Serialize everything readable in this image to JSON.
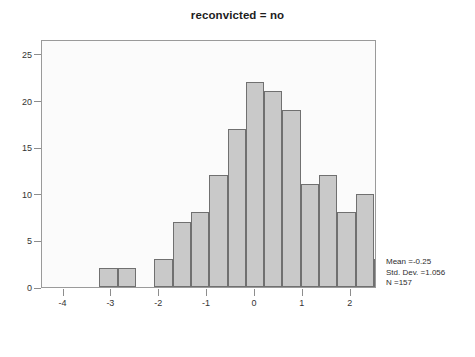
{
  "chart_data": {
    "type": "bar",
    "title": "reconvicted = no",
    "xlabel": "",
    "ylabel": "",
    "xlim": [
      -4.45,
      2.55
    ],
    "ylim": [
      0,
      26.6
    ],
    "grid": false,
    "legend": null,
    "bin_width": 0.3825,
    "bin_starts": [
      -3.25,
      -2.8675,
      -2.485,
      -2.1025,
      -1.72,
      -1.3375,
      -0.955,
      -0.5725,
      -0.19,
      0.1925,
      0.575,
      0.9575,
      1.34,
      1.7225,
      2.105,
      2.4875
    ],
    "categories": [
      "-3.25",
      "-2.87",
      "-2.48",
      "-2.10",
      "-1.72",
      "-1.34",
      "-0.96",
      "-0.57",
      "-0.19",
      "0.19",
      "0.58",
      "0.96",
      "1.34",
      "1.72",
      "2.11",
      "2.49"
    ],
    "values": [
      2,
      2,
      0,
      3,
      7,
      8,
      12,
      17,
      22,
      21,
      19,
      11,
      12,
      8,
      10,
      3
    ],
    "x_ticks": [
      -4,
      -3,
      -2,
      -1,
      0,
      1,
      2
    ],
    "x_tick_labels": [
      "-4",
      "-3",
      "-2",
      "-1",
      "0",
      "1",
      "2"
    ],
    "y_ticks": [
      0,
      5,
      10,
      15,
      20,
      25
    ],
    "y_tick_labels": [
      "0",
      "5",
      "10",
      "15",
      "20",
      "25"
    ],
    "bar_fill_color": "#c9c9c9",
    "bar_border_color": "#707070",
    "plot_background": "#fbfbfb",
    "frame_color": "#9a9a9a"
  },
  "annotations": {
    "stats": {
      "mean_label": "Mean =-0.25",
      "std_dev_label": "Std. Dev. =1.056",
      "n_label": "N =157"
    }
  }
}
